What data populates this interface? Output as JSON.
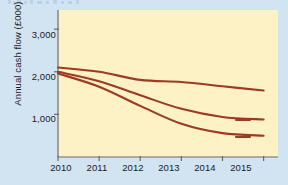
{
  "figure": {
    "background_color": "#d2e3f2",
    "plot_background_color": "#fdf2c6",
    "line_color": "#9c3a22",
    "axis_color": "#6b6b6b"
  },
  "chart_data": {
    "type": "line",
    "title": "",
    "subtitle": "",
    "xlabel": "",
    "ylabel": "Annual cash flow (£000)",
    "x": [
      2010,
      2011,
      2012,
      2013,
      2014,
      2015
    ],
    "xtick_labels": [
      "2010",
      "2011",
      "2012",
      "2013",
      "2014",
      "2015"
    ],
    "ytick_labels": [
      "1,000",
      "2,000",
      "3,000"
    ],
    "yticks": [
      1000,
      2000,
      3000
    ],
    "xlim": [
      2010,
      2015.35
    ],
    "ylim": [
      0,
      3450
    ],
    "grid": false,
    "legend_position": "inline-right",
    "series": [
      {
        "name": "Base case",
        "annotation": "Base case",
        "color": "#9c3a22",
        "values": [
          2100,
          2000,
          1810,
          1760,
          1660,
          1560
        ]
      },
      {
        "name": "+2%",
        "annotation": "+2%",
        "color": "#9c3a22",
        "values": [
          2000,
          1780,
          1450,
          1130,
          940,
          880
        ]
      },
      {
        "name": "+3%",
        "annotation": "+3%",
        "color": "#9c3a22",
        "values": [
          1960,
          1650,
          1200,
          780,
          560,
          500
        ]
      }
    ]
  }
}
